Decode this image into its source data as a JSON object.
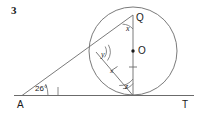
{
  "figure": {
    "problem_number": "3",
    "background_color": "#ffffff",
    "stroke_color": "#555555",
    "text_color": "#1a1a1a",
    "width": 201,
    "height": 117
  },
  "points": [
    {
      "name": "A",
      "label": "A",
      "x": 22,
      "y": 96,
      "label_x": 17,
      "label_y": 100
    },
    {
      "name": "T",
      "label": "T",
      "x": 186,
      "y": 96,
      "label_x": 182,
      "label_y": 100
    },
    {
      "name": "Q",
      "label": "Q",
      "x": 133,
      "y": 15,
      "label_x": 136,
      "label_y": 17
    },
    {
      "name": "O",
      "label": "O",
      "x": 133,
      "y": 51,
      "label_x": 138,
      "label_y": 47
    },
    {
      "name": "P",
      "label": "",
      "x": 133,
      "y": 95,
      "label_x": 0,
      "label_y": 0
    },
    {
      "name": "B",
      "label": "",
      "x": 96,
      "y": 52,
      "label_x": 0,
      "label_y": 0
    }
  ],
  "angles": [
    {
      "name": "angle-A",
      "label": "26°",
      "vertex": "A",
      "label_x": 35,
      "label_y": 88,
      "arcs": 1
    },
    {
      "name": "angle-x",
      "label": "x",
      "vertex": "Q",
      "label_x": 127,
      "label_y": 28,
      "arcs": 1
    },
    {
      "name": "angle-y",
      "label": "y",
      "vertex": "B",
      "label_x": 102,
      "label_y": 53,
      "arcs": 2
    },
    {
      "name": "angle-z",
      "label": "z",
      "vertex": "P",
      "label_x": 126,
      "label_y": 85,
      "arcs": 2
    }
  ],
  "side_marks": [
    {
      "name": "chord-tick",
      "label": "x",
      "label_x": 110,
      "label_y": 72
    },
    {
      "name": "radius-tick",
      "label": "",
      "label_x": 0,
      "label_y": 0
    }
  ],
  "circle": {
    "center_x": 133,
    "center_y": 51,
    "radius": 44
  },
  "lines": {
    "tangent": {
      "name": "line-AT",
      "x1": 14,
      "y1": 95.5,
      "x2": 194,
      "y2": 95.5
    },
    "secant": {
      "name": "line-A-through-Q",
      "x1": 22,
      "y1": 95.5,
      "x2": 133,
      "y2": 15
    },
    "chord": {
      "name": "chord-B-P",
      "x1": 96,
      "y1": 52,
      "x2": 133,
      "y2": 95
    },
    "diameter": {
      "name": "diameter-Q-P",
      "x1": 133,
      "y1": 15,
      "x2": 133,
      "y2": 95
    }
  }
}
